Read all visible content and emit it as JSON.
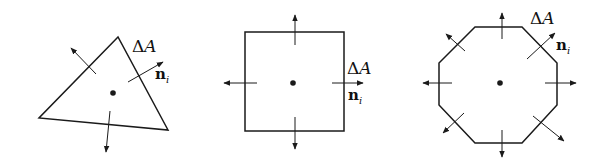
{
  "figure": {
    "colors": {
      "stroke": "#1a1a1a",
      "background": "#ffffff"
    },
    "panels": [
      {
        "shape": "triangle",
        "labels": {
          "area_symbol": "Δ",
          "area_var": "A",
          "normal_main": "n",
          "normal_sub": "i"
        }
      },
      {
        "shape": "square",
        "labels": {
          "area_symbol": "Δ",
          "area_var": "A",
          "normal_main": "n",
          "normal_sub": "i"
        }
      },
      {
        "shape": "octagon",
        "labels": {
          "area_symbol": "Δ",
          "area_var": "A",
          "normal_main": "n",
          "normal_sub": "i"
        }
      }
    ]
  }
}
